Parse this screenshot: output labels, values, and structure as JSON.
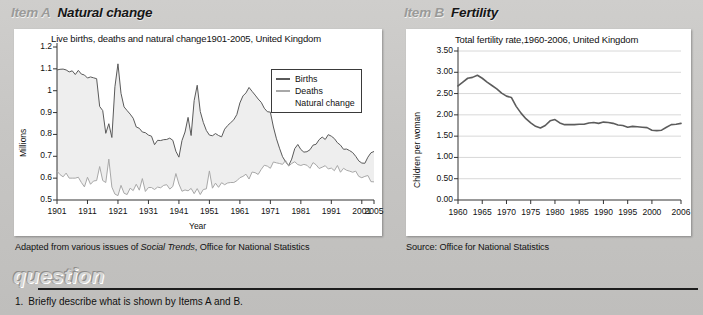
{
  "item_a": {
    "tag": "Item A",
    "title": "Natural change",
    "caption_prefix": "Adapted from various issues of ",
    "caption_italic": "Social Trends",
    "caption_suffix": ", Office for National Statistics"
  },
  "item_b": {
    "tag": "Item B",
    "title": "Fertility",
    "caption": "Source: Office for National Statistics"
  },
  "question": {
    "heading": "question",
    "items": [
      {
        "number": "1.",
        "text": "Briefly describe what is shown by Items A and B."
      }
    ]
  },
  "chart_data": [
    {
      "id": "chart-a",
      "type": "line",
      "title": "Live births, deaths and natural change1901-2005, United Kingdom",
      "xlabel": "Year",
      "ylabel": "Millions",
      "ylim": [
        0.5,
        1.2
      ],
      "xlim": [
        1901,
        2005
      ],
      "yticks": [
        "0.5",
        "0.6",
        "0.7",
        "0.8",
        "0.9",
        "1",
        "1.1",
        "1.2"
      ],
      "ytick_values": [
        0.5,
        0.6,
        0.7,
        0.8,
        0.9,
        1.0,
        1.1,
        1.2
      ],
      "xticks": [
        "1901",
        "1911",
        "1921",
        "1931",
        "1941",
        "1951",
        "1961",
        "1971",
        "1981",
        "1991",
        "2001",
        "2005"
      ],
      "xtick_values": [
        1901,
        1911,
        1921,
        1931,
        1941,
        1951,
        1961,
        1971,
        1981,
        1991,
        2001,
        2005
      ],
      "grid": false,
      "legend_position": "top-right",
      "legend": [
        {
          "name": "Births",
          "color": "#5a5a5a"
        },
        {
          "name": "Deaths",
          "color": "#a8a8a8"
        },
        {
          "name": "Natural change",
          "color": "#eeeeee"
        }
      ],
      "x": [
        1901,
        1902,
        1903,
        1904,
        1905,
        1906,
        1907,
        1908,
        1909,
        1910,
        1911,
        1912,
        1913,
        1914,
        1915,
        1916,
        1917,
        1918,
        1919,
        1920,
        1921,
        1922,
        1923,
        1924,
        1925,
        1926,
        1927,
        1928,
        1929,
        1930,
        1931,
        1932,
        1933,
        1934,
        1935,
        1936,
        1937,
        1938,
        1939,
        1940,
        1941,
        1942,
        1943,
        1944,
        1945,
        1946,
        1947,
        1948,
        1949,
        1950,
        1951,
        1952,
        1953,
        1954,
        1955,
        1956,
        1957,
        1958,
        1959,
        1960,
        1961,
        1962,
        1963,
        1964,
        1965,
        1966,
        1967,
        1968,
        1969,
        1970,
        1971,
        1972,
        1973,
        1974,
        1975,
        1976,
        1977,
        1978,
        1979,
        1980,
        1981,
        1982,
        1983,
        1984,
        1985,
        1986,
        1987,
        1988,
        1989,
        1990,
        1991,
        1992,
        1993,
        1994,
        1995,
        1996,
        1997,
        1998,
        1999,
        2000,
        2001,
        2002,
        2003,
        2004,
        2005
      ],
      "series": [
        {
          "name": "Births",
          "color": "#5a5a5a",
          "values": [
            1.095,
            1.098,
            1.099,
            1.095,
            1.086,
            1.091,
            1.074,
            1.093,
            1.076,
            1.072,
            1.058,
            1.063,
            1.059,
            1.055,
            0.928,
            0.909,
            0.805,
            0.849,
            0.786,
            1.018,
            1.123,
            0.988,
            0.926,
            0.909,
            0.893,
            0.874,
            0.834,
            0.828,
            0.811,
            0.808,
            0.797,
            0.792,
            0.753,
            0.773,
            0.772,
            0.776,
            0.777,
            0.783,
            0.773,
            0.723,
            0.696,
            0.772,
            0.811,
            0.878,
            0.795,
            0.955,
            1.025,
            0.905,
            0.855,
            0.818,
            0.797,
            0.794,
            0.804,
            0.795,
            0.789,
            0.824,
            0.841,
            0.854,
            0.867,
            0.891,
            0.944,
            0.976,
            0.99,
            1.015,
            0.997,
            0.98,
            0.962,
            0.947,
            0.92,
            0.904,
            0.902,
            0.834,
            0.78,
            0.737,
            0.698,
            0.675,
            0.657,
            0.687,
            0.735,
            0.754,
            0.731,
            0.719,
            0.721,
            0.73,
            0.751,
            0.755,
            0.776,
            0.788,
            0.777,
            0.799,
            0.792,
            0.781,
            0.762,
            0.751,
            0.732,
            0.733,
            0.726,
            0.717,
            0.7,
            0.679,
            0.669,
            0.668,
            0.696,
            0.716,
            0.722
          ]
        },
        {
          "name": "Deaths",
          "color": "#a8a8a8",
          "values": [
            0.632,
            0.616,
            0.606,
            0.623,
            0.6,
            0.6,
            0.6,
            0.604,
            0.58,
            0.56,
            0.604,
            0.572,
            0.587,
            0.589,
            0.653,
            0.589,
            0.58,
            0.687,
            0.559,
            0.527,
            0.52,
            0.567,
            0.531,
            0.525,
            0.554,
            0.543,
            0.572,
            0.545,
            0.598,
            0.539,
            0.557,
            0.557,
            0.548,
            0.559,
            0.556,
            0.567,
            0.57,
            0.55,
            0.562,
            0.621,
            0.573,
            0.54,
            0.546,
            0.542,
            0.553,
            0.529,
            0.552,
            0.525,
            0.548,
            0.551,
            0.633,
            0.554,
            0.577,
            0.558,
            0.579,
            0.57,
            0.578,
            0.58,
            0.58,
            0.588,
            0.602,
            0.608,
            0.618,
            0.596,
            0.628,
            0.625,
            0.617,
            0.64,
            0.659,
            0.655,
            0.645,
            0.674,
            0.67,
            0.667,
            0.663,
            0.681,
            0.655,
            0.667,
            0.675,
            0.662,
            0.658,
            0.663,
            0.659,
            0.645,
            0.671,
            0.661,
            0.644,
            0.65,
            0.657,
            0.642,
            0.646,
            0.634,
            0.658,
            0.627,
            0.645,
            0.636,
            0.632,
            0.627,
            0.632,
            0.608,
            0.602,
            0.608,
            0.612,
            0.584,
            0.583
          ]
        }
      ]
    },
    {
      "id": "chart-b",
      "type": "line",
      "title": "Total fertility rate,1960-2006, United Kingdom",
      "xlabel": "",
      "ylabel": "Children per woman",
      "ylim": [
        0.0,
        3.5
      ],
      "xlim": [
        1960,
        2006
      ],
      "yticks": [
        "0.00",
        "0.50",
        "1.00",
        "1.50",
        "2.00",
        "2.50",
        "3.00",
        "3.50"
      ],
      "ytick_values": [
        0.0,
        0.5,
        1.0,
        1.5,
        2.0,
        2.5,
        3.0,
        3.5
      ],
      "xticks": [
        "1960",
        "1965",
        "1970",
        "1975",
        "1980",
        "1985",
        "1990",
        "1995",
        "2000",
        "2006"
      ],
      "xtick_values": [
        1960,
        1965,
        1970,
        1975,
        1980,
        1985,
        1990,
        1995,
        2000,
        2006
      ],
      "grid": true,
      "legend_position": "none",
      "x": [
        1960,
        1961,
        1962,
        1963,
        1964,
        1965,
        1966,
        1967,
        1968,
        1969,
        1970,
        1971,
        1972,
        1973,
        1974,
        1975,
        1976,
        1977,
        1978,
        1979,
        1980,
        1981,
        1982,
        1983,
        1984,
        1985,
        1986,
        1987,
        1988,
        1989,
        1990,
        1991,
        1992,
        1993,
        1994,
        1995,
        1996,
        1997,
        1998,
        1999,
        2000,
        2001,
        2002,
        2003,
        2004,
        2005,
        2006
      ],
      "series": [
        {
          "name": "Total fertility rate",
          "color": "#5c5c5c",
          "values": [
            2.68,
            2.77,
            2.86,
            2.88,
            2.93,
            2.86,
            2.77,
            2.69,
            2.61,
            2.51,
            2.44,
            2.41,
            2.2,
            2.04,
            1.91,
            1.81,
            1.73,
            1.69,
            1.75,
            1.86,
            1.89,
            1.81,
            1.77,
            1.77,
            1.77,
            1.78,
            1.78,
            1.81,
            1.82,
            1.8,
            1.83,
            1.82,
            1.8,
            1.76,
            1.75,
            1.71,
            1.73,
            1.72,
            1.71,
            1.7,
            1.64,
            1.63,
            1.64,
            1.71,
            1.77,
            1.78,
            1.8
          ]
        }
      ]
    }
  ]
}
